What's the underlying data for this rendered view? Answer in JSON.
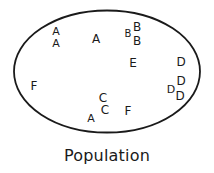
{
  "diagram": {
    "caption": "Population",
    "caption_position": {
      "x": 107,
      "y": 155,
      "font_size": 16
    },
    "colors": {
      "stroke": "#1a1a1a",
      "text": "#1a1a1a",
      "background": "#ffffff"
    },
    "boundary": {
      "shape": "ellipse",
      "center_x": 107,
      "center_y": 71.5,
      "radius_x": 93,
      "radius_y": 61,
      "stroke_width": 1.8,
      "fill": "none"
    },
    "members": [
      {
        "label": "A",
        "x": 56,
        "y": 31,
        "size": 11
      },
      {
        "label": "A",
        "x": 56,
        "y": 43,
        "size": 11
      },
      {
        "label": "A",
        "x": 96,
        "y": 39,
        "size": 12
      },
      {
        "label": "B",
        "x": 128,
        "y": 34,
        "size": 10
      },
      {
        "label": "B",
        "x": 137,
        "y": 27,
        "size": 12
      },
      {
        "label": "B",
        "x": 137,
        "y": 41,
        "size": 12
      },
      {
        "label": "E",
        "x": 133,
        "y": 63,
        "size": 12
      },
      {
        "label": "D",
        "x": 181,
        "y": 62,
        "size": 12
      },
      {
        "label": "D",
        "x": 181,
        "y": 81,
        "size": 12
      },
      {
        "label": "D",
        "x": 171,
        "y": 89,
        "size": 11
      },
      {
        "label": "D",
        "x": 180,
        "y": 96,
        "size": 12
      },
      {
        "label": "F",
        "x": 34,
        "y": 86,
        "size": 12
      },
      {
        "label": "C",
        "x": 103,
        "y": 98,
        "size": 12
      },
      {
        "label": "C",
        "x": 105,
        "y": 110,
        "size": 12
      },
      {
        "label": "A",
        "x": 91,
        "y": 118,
        "size": 11
      },
      {
        "label": "F",
        "x": 128,
        "y": 111,
        "size": 12
      }
    ]
  }
}
